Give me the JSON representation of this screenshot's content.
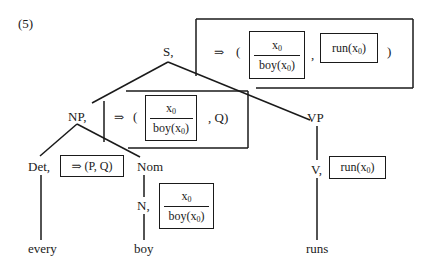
{
  "example_number": "(5)",
  "nodes": {
    "S": {
      "label": "S,"
    },
    "NP": {
      "label": "NP,"
    },
    "VP": {
      "label": "VP"
    },
    "Det": {
      "label": "Det,"
    },
    "Nom": {
      "label": "Nom"
    },
    "N": {
      "label": "N,"
    },
    "V": {
      "label": "V,"
    }
  },
  "leaves": {
    "every": "every",
    "boy": "boy",
    "runs": "runs"
  },
  "annotations": {
    "S": {
      "arrow": "⇒",
      "open_paren": "(",
      "drs_top": "x0",
      "drs_bottom": "boy(x0)",
      "comma": ",",
      "second_box": "run(x0)",
      "close_paren": ")"
    },
    "NP": {
      "arrow": "⇒",
      "open_paren": "(",
      "drs_top": "x0",
      "drs_bottom": "boy(x0)",
      "rest": ",  Q)"
    },
    "Det": {
      "text": "⇒  (P, Q)"
    },
    "N": {
      "drs_top": "x0",
      "drs_bottom": "boy(x0)"
    },
    "V": {
      "text": "run(x0)"
    }
  }
}
